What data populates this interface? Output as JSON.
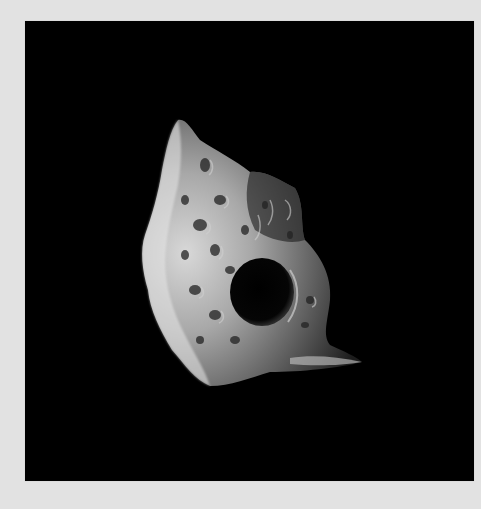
{
  "image": {
    "subject": "irregular cratered moon / asteroid against black space",
    "background_color": "#e2e2e2",
    "frame_color": "#000000"
  }
}
